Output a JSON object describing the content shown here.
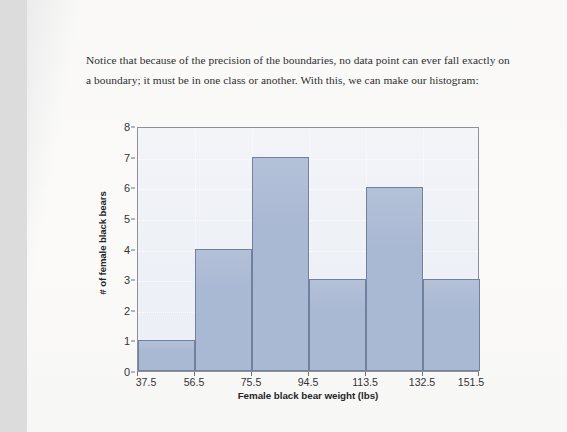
{
  "document": {
    "paragraph": "Notice that because of the precision of the boundaries, no data point can ever fall exactly on a boundary; it must be in one class or another. With this, we can make our histogram:"
  },
  "colors": {
    "bar_fill": "#a9b8d3",
    "bar_stroke": "#70819e",
    "plot_background": "#eef1f7",
    "axis": "#8d9099",
    "grid": "#ffffff",
    "page": "#faf9f8",
    "text": "#2d2e30"
  },
  "chart_data": {
    "type": "bar",
    "title": "",
    "xlabel": "Female black bear weight (lbs)",
    "ylabel": "# of female black bears",
    "categories": [
      "37.5-56.5",
      "56.5-75.5",
      "75.5-94.5",
      "94.5-113.5",
      "113.5-132.5",
      "132.5-151.5"
    ],
    "values": [
      1,
      4,
      7,
      3,
      6,
      3
    ],
    "bin_edges": [
      37.5,
      56.5,
      75.5,
      94.5,
      113.5,
      132.5,
      151.5
    ],
    "bin_width": 19,
    "xtick_labels": [
      "37.5",
      "56.5",
      "75.5",
      "94.5",
      "113.5",
      "132.5",
      "151.5"
    ],
    "ytick_labels": [
      "0",
      "1",
      "2",
      "3",
      "4",
      "5",
      "6",
      "7",
      "8"
    ],
    "ytick_values": [
      0,
      1,
      2,
      3,
      4,
      5,
      6,
      7,
      8
    ],
    "xlim": [
      37.5,
      151.5
    ],
    "ylim": [
      0,
      8
    ],
    "grid": true,
    "legend": null,
    "legend_position": "none"
  }
}
